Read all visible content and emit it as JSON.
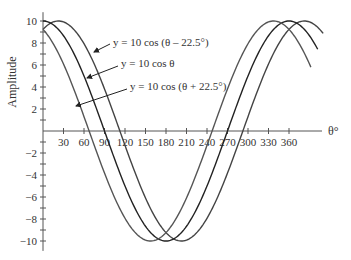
{
  "chart_data": {
    "type": "line",
    "title": "",
    "xlabel": "θ°",
    "ylabel": "Amplitude",
    "xlim": [
      0,
      410
    ],
    "ylim": [
      -10,
      10
    ],
    "grid": false,
    "x_ticks": [
      30,
      60,
      90,
      120,
      150,
      180,
      210,
      240,
      270,
      300,
      330,
      360
    ],
    "y_ticks": [
      10,
      8,
      6,
      4,
      2,
      -2,
      -4,
      -6,
      -8,
      -10
    ],
    "y_tick_labels": [
      "10",
      "8",
      "6",
      "4",
      "2",
      "−2",
      "−4",
      "−6",
      "−8",
      "−10"
    ],
    "series": [
      {
        "name": "y = 10 cos (θ – 22.5°)",
        "amplitude": 10,
        "phase_deg": -22.5,
        "x_end": 410,
        "color": "#444444"
      },
      {
        "name": "y = 10 cos θ",
        "amplitude": 10,
        "phase_deg": 0,
        "x_end": 402,
        "color": "#222222"
      },
      {
        "name": "y = 10 cos (θ + 22.5°)",
        "amplitude": 10,
        "phase_deg": 22.5,
        "x_end": 392,
        "color": "#555555"
      }
    ],
    "annotations": [
      {
        "text": "y = 10 cos (θ – 22.5°)",
        "target_series": 0
      },
      {
        "text": "y = 10 cos θ",
        "target_series": 1
      },
      {
        "text": "y = 10 cos (θ + 22.5°)",
        "target_series": 2
      }
    ],
    "legend": "inline-arrows"
  }
}
